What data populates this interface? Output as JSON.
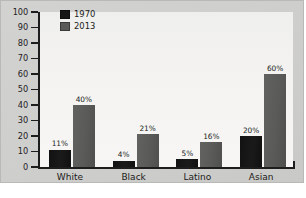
{
  "chart_data": {
    "type": "bar",
    "title": "",
    "xlabel": "",
    "ylabel": "",
    "categories": [
      "White",
      "Black",
      "Latino",
      "Asian"
    ],
    "series": [
      {
        "name": "1970",
        "color": "#161616",
        "values": [
          11,
          4,
          5,
          20
        ],
        "labels": [
          "11%",
          "4%",
          "5%",
          "20%"
        ]
      },
      {
        "name": "2013",
        "color": "#5a5a58",
        "values": [
          40,
          21,
          16,
          60
        ],
        "labels": [
          "40%",
          "21%",
          "16%",
          "60%"
        ]
      }
    ],
    "ylim": [
      0,
      100
    ],
    "ytick_values": [
      100,
      90,
      80,
      70,
      60,
      50,
      40,
      30,
      20,
      10,
      0
    ],
    "ytick_labels": [
      "100",
      "90",
      "80",
      "70",
      "60",
      "50",
      "40",
      "30",
      "20",
      "10",
      "0"
    ],
    "grid": false,
    "legend_position": "top-left",
    "value_labels_shown": true
  },
  "legend": {
    "entries": [
      {
        "label": "1970",
        "swatch": "legend-swatch-1970"
      },
      {
        "label": "2013",
        "swatch": "legend-swatch-2013"
      }
    ]
  },
  "colors": {
    "series_1970": "#161616",
    "series_2013": "#5a5a58",
    "axis": "#1d1d1d",
    "plot_background": "#f4f3f1",
    "figure_background": "#cfcfcd"
  }
}
